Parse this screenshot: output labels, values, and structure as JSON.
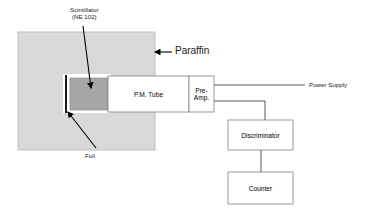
{
  "diagram": {
    "colors": {
      "paraffin_fill": "#d9d9d9",
      "paraffin_stroke": "#bfbfbf",
      "scintillator_fill": "#a6a6a6",
      "scintillator_stroke": "#8c8c8c",
      "foil_stroke": "#000000",
      "box_fill": "#ffffff",
      "box_stroke": "#808080",
      "line_stroke": "#595959",
      "arrow_stroke": "#000000",
      "text": "#1a1a1a"
    },
    "annotations": {
      "scintillator_line1": "Scintillator",
      "scintillator_line2": "(NE 102)",
      "paraffin": "Paraffin",
      "foil": "Foil",
      "power_supply": "Power Supply"
    },
    "blocks": {
      "pm_tube": "P.M. Tube",
      "preamp_line1": "Pre-",
      "preamp_line2": "Amp.",
      "discriminator": "Discriminator",
      "counter": "Counter"
    }
  }
}
